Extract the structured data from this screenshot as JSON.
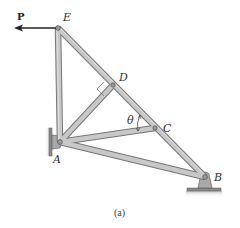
{
  "figure": {
    "caption": "(a)",
    "load": {
      "label": "P",
      "direction": "left",
      "applied_at": "E"
    },
    "angle_label": "θ",
    "joints": [
      {
        "id": "E",
        "label": "E",
        "x": 58,
        "y": 28
      },
      {
        "id": "D",
        "label": "D",
        "x": 113,
        "y": 85
      },
      {
        "id": "C",
        "label": "C",
        "x": 155,
        "y": 128
      },
      {
        "id": "A",
        "label": "A",
        "x": 60,
        "y": 142
      },
      {
        "id": "B",
        "label": "B",
        "x": 205,
        "y": 177
      }
    ],
    "members": [
      "EA",
      "ED",
      "DC",
      "CB",
      "AD",
      "AC",
      "AB"
    ],
    "supports": [
      {
        "joint": "A",
        "type": "pin-wall"
      },
      {
        "joint": "B",
        "type": "pin-ground"
      }
    ],
    "right_angle_at": "D",
    "colors": {
      "member_fill": "#c8c8c8",
      "member_edge": "#777777",
      "support_fill": "#a9a9a9",
      "arrow": "#222222"
    }
  }
}
